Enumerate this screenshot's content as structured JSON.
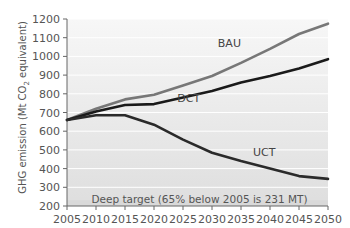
{
  "chart_data": {
    "type": "line",
    "title": "",
    "xlabel": "",
    "ylabel": "GHG emission (Mt CO2 equivalent)",
    "ylabel_parts": {
      "pre": "GHG emission (Mt CO",
      "sub": "2",
      "post": " equivalent)"
    },
    "x": [
      2005,
      2010,
      2015,
      2020,
      2025,
      2030,
      2035,
      2040,
      2045,
      2050
    ],
    "xlim": [
      2005,
      2050
    ],
    "ylim": [
      200,
      1200
    ],
    "yticks": [
      200,
      300,
      400,
      500,
      600,
      700,
      800,
      900,
      1000,
      1100,
      1200
    ],
    "xticks": [
      2005,
      2010,
      2015,
      2020,
      2025,
      2030,
      2035,
      2040,
      2045,
      2050
    ],
    "grid": "horizontal",
    "series": [
      {
        "name": "BAU",
        "color": "#777777",
        "values": [
          660,
          720,
          770,
          795,
          845,
          895,
          965,
          1040,
          1120,
          1175
        ],
        "label_at": [
          2033,
          1050
        ]
      },
      {
        "name": "DCT",
        "color": "#1a1a1a",
        "values": [
          660,
          705,
          740,
          745,
          780,
          815,
          860,
          895,
          935,
          985
        ],
        "label_at": [
          2026,
          755
        ]
      },
      {
        "name": "UCT",
        "color": "#2a2a2a",
        "values": [
          660,
          685,
          685,
          635,
          555,
          485,
          440,
          400,
          360,
          345
        ],
        "label_at": [
          2039,
          465
        ]
      }
    ],
    "annotations": [
      {
        "text": "Deep target (65% below 2005 is 231 MT)",
        "band": [
          200,
          231
        ]
      }
    ]
  }
}
